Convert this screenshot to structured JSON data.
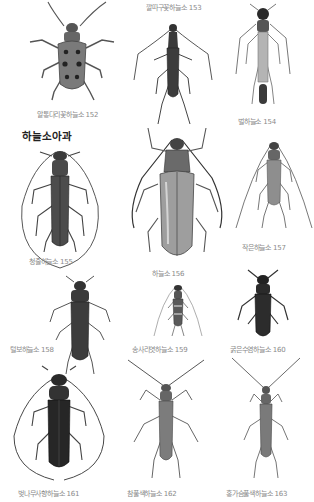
{
  "page": {
    "section_heading": "하늘소아과",
    "species": [
      {
        "id": "152",
        "label": "알통다리꽃하늘소 152",
        "tone": "#6e6e6e",
        "spots": true
      },
      {
        "id": "153",
        "label": "깔따구꽃하늘소 153",
        "tone": "#3a3a3a"
      },
      {
        "id": "154",
        "label": "벌하늘소 154",
        "tone": "#8a8a8a"
      },
      {
        "id": "155",
        "label": "청줄하늘소 155",
        "tone": "#4a4a4a"
      },
      {
        "id": "156",
        "label": "하늘소 156",
        "tone": "#9a9a9a"
      },
      {
        "id": "157",
        "label": "작은하늘소 157",
        "tone": "#8e8e8e"
      },
      {
        "id": "158",
        "label": "털보하늘소 158",
        "tone": "#3c3c3c"
      },
      {
        "id": "159",
        "label": "송사리엿하늘소 159",
        "tone": "#5a5a5a"
      },
      {
        "id": "160",
        "label": "굵은수염하늘소 160",
        "tone": "#2a2a2a"
      },
      {
        "id": "161",
        "label": "벚나무사향하늘소 161",
        "tone": "#262626"
      },
      {
        "id": "162",
        "label": "참풀색하늘소 162",
        "tone": "#7c7c7c"
      },
      {
        "id": "163",
        "label": "홍가슴풀색하늘소 163",
        "tone": "#7a7a7a"
      }
    ]
  }
}
